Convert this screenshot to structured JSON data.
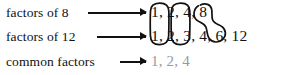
{
  "diagram": {
    "background_color": "#ffffff",
    "ink_color": "#111111",
    "muted_color": "#9a9a9a",
    "rows": [
      {
        "label": "factors of 8",
        "numbers": "1, 2, 4, 8",
        "values": [
          1,
          2,
          4,
          8
        ]
      },
      {
        "label": "factors of 12",
        "numbers": "1, 2, 3, 4, 6, 12",
        "values": [
          1,
          2,
          3,
          4,
          6,
          12
        ]
      },
      {
        "label": "common factors",
        "numbers": "1, 2, 4",
        "values": [
          1,
          2,
          4
        ]
      }
    ],
    "annotations": {
      "oval_one_label": "oval grouping the 1 in both factor lists",
      "oval_two_label": "oval grouping the 2 in both factor lists",
      "loop_four_label": "loop connecting the 4 in both factor lists",
      "arrow_label": "arrow"
    }
  }
}
